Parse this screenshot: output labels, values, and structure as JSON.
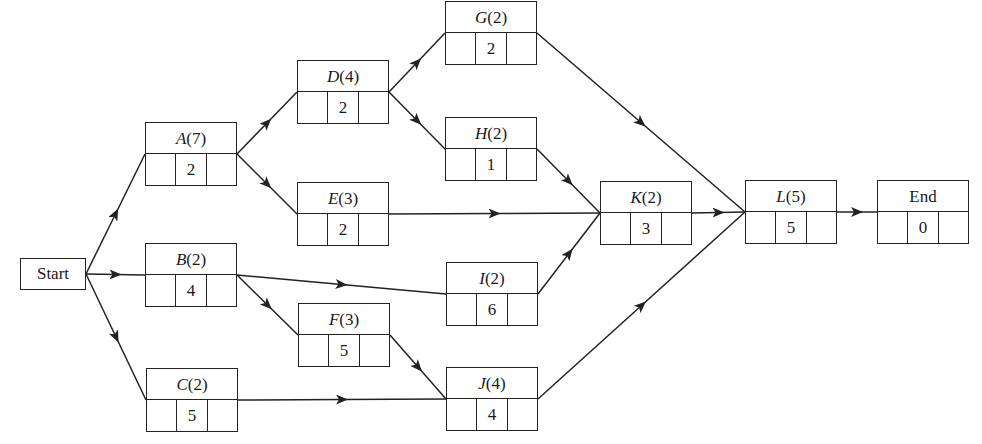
{
  "diagram": {
    "type": "activity-on-node network",
    "start": {
      "label": "Start",
      "x": 20,
      "y": 258,
      "w": 66,
      "h": 32
    },
    "nodes": [
      {
        "id": "A",
        "letter": "A",
        "duration": "(7)",
        "value": "2",
        "x": 145,
        "y": 122
      },
      {
        "id": "B",
        "letter": "B",
        "duration": "(2)",
        "value": "4",
        "x": 145,
        "y": 243
      },
      {
        "id": "C",
        "letter": "C",
        "duration": "(2)",
        "value": "5",
        "x": 146,
        "y": 368
      },
      {
        "id": "D",
        "letter": "D",
        "duration": "(4)",
        "value": "2",
        "x": 297,
        "y": 60
      },
      {
        "id": "E",
        "letter": "E",
        "duration": "(3)",
        "value": "2",
        "x": 297,
        "y": 182
      },
      {
        "id": "F",
        "letter": "F",
        "duration": "(3)",
        "value": "5",
        "x": 298,
        "y": 303
      },
      {
        "id": "G",
        "letter": "G",
        "duration": "(2)",
        "value": "2",
        "x": 445,
        "y": 1
      },
      {
        "id": "H",
        "letter": "H",
        "duration": "(2)",
        "value": "1",
        "x": 445,
        "y": 117
      },
      {
        "id": "I",
        "letter": "I",
        "duration": "(2)",
        "value": "6",
        "x": 446,
        "y": 262
      },
      {
        "id": "J",
        "letter": "J",
        "duration": "(4)",
        "value": "4",
        "x": 446,
        "y": 367
      },
      {
        "id": "K",
        "letter": "K",
        "duration": "(2)",
        "value": "3",
        "x": 600,
        "y": 181
      },
      {
        "id": "L",
        "letter": "L",
        "duration": "(5)",
        "value": "5",
        "x": 745,
        "y": 180
      },
      {
        "id": "End",
        "letter": "",
        "duration": "End",
        "value": "0",
        "x": 877,
        "y": 180
      }
    ],
    "edges": [
      [
        "Start",
        "A"
      ],
      [
        "Start",
        "B"
      ],
      [
        "Start",
        "C"
      ],
      [
        "A",
        "D"
      ],
      [
        "A",
        "E"
      ],
      [
        "B",
        "I"
      ],
      [
        "B",
        "F"
      ],
      [
        "C",
        "J"
      ],
      [
        "D",
        "G"
      ],
      [
        "D",
        "H"
      ],
      [
        "E",
        "K"
      ],
      [
        "F",
        "J"
      ],
      [
        "G",
        "L"
      ],
      [
        "H",
        "K"
      ],
      [
        "I",
        "K"
      ],
      [
        "J",
        "L"
      ],
      [
        "K",
        "L"
      ],
      [
        "L",
        "End"
      ]
    ],
    "node_size": {
      "w": 92,
      "h": 64
    },
    "line_color": "#222222"
  }
}
